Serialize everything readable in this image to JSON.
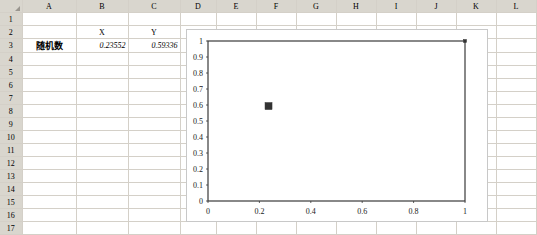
{
  "spreadsheet": {
    "columns": [
      "A",
      "B",
      "C",
      "D",
      "E",
      "F",
      "G",
      "H",
      "I",
      "J",
      "K",
      "L"
    ],
    "rows": [
      "1",
      "2",
      "3",
      "4",
      "5",
      "6",
      "7",
      "8",
      "9",
      "10",
      "11",
      "12",
      "13",
      "14",
      "15",
      "16",
      "17"
    ],
    "corner_icon": "select-all-triangle-icon",
    "cells": {
      "B2": "X",
      "C2": "Y",
      "A3": "随机数",
      "B3": "0.23552",
      "C3": "0.59336"
    }
  },
  "chart_data": {
    "type": "scatter",
    "title": "",
    "xlabel": "",
    "ylabel": "",
    "xlim": [
      0,
      1
    ],
    "ylim": [
      0,
      1
    ],
    "grid": false,
    "legend": "none",
    "x_ticks": [
      "0",
      "0.2",
      "0.4",
      "0.6",
      "0.8",
      "1"
    ],
    "x_tick_values": [
      0,
      0.2,
      0.4,
      0.6,
      0.8,
      1
    ],
    "y_ticks": [
      "0",
      "0.1",
      "0.2",
      "0.3",
      "0.4",
      "0.5",
      "0.6",
      "0.7",
      "0.8",
      "0.9",
      "1"
    ],
    "y_tick_values": [
      0,
      0.1,
      0.2,
      0.3,
      0.4,
      0.5,
      0.6,
      0.7,
      0.8,
      0.9,
      1
    ],
    "series": [
      {
        "name": "随机数",
        "marker": "square",
        "color": "#333333",
        "points": [
          {
            "x": 0.23552,
            "y": 0.59336,
            "size": 7
          },
          {
            "x": 1,
            "y": 1,
            "size": 3
          }
        ]
      }
    ]
  }
}
